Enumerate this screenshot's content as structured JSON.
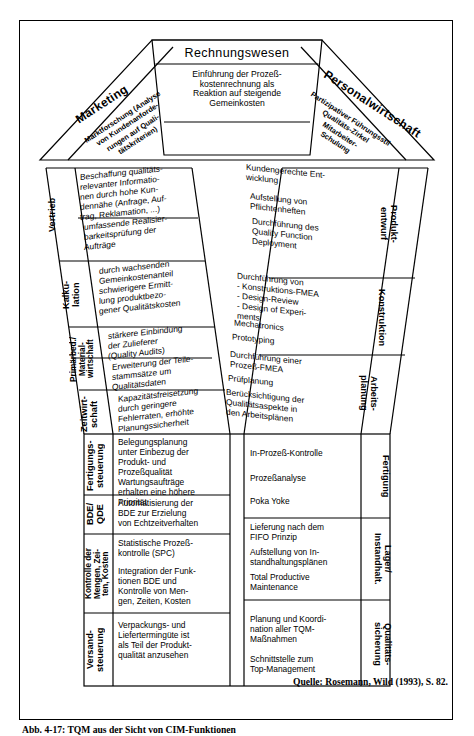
{
  "figure": {
    "source_note": "Quelle: Rosemann, Wild (1993), S. 82.",
    "caption": "Abb. 4-17: TQM aus der Sicht von CIM-Funktionen"
  },
  "roof": {
    "center": {
      "title": "Rechnungswesen",
      "body": "Einführung der Prozeß-\nkostenrechnung als\nReaktion auf steigende\nGemeinkosten"
    },
    "left": {
      "title": "Marketing",
      "body": "Marktforschung (Analyse\nvon Kundenanforde-\nrungen auf Quali-\ntätskriterien)"
    },
    "right": {
      "title": "Personalwirtschaft",
      "body": "Partizipativer Führungsstil\nQualitäts-Zirkel\nMitarbeiter-\nSchulung"
    }
  },
  "left_column": [
    {
      "dept": "Vertrieb",
      "items": [
        "Beschaffung qualitäts-\nrelevanter Informatio-\nnen durch hohe Kun-\ndennähe (Anfrage, Auf-\ntrag, Reklamation, ...)",
        "umfassende Realisier-\nbarkeitsprüfung der\nAufträge"
      ]
    },
    {
      "dept": "Kalku-\nlation",
      "items": [
        "durch wachsenden\nGemeinkostenanteil\nschwierigere Ermitt-\nlung produktbezo-\ngener Qualitätskosten"
      ]
    },
    {
      "dept": "Primärbed./\nMaterial-\nwirtschaft",
      "items": [
        "stärkere Einbindung\nder Zulieferer\n(Quality Audits)",
        "Erweiterung der Teile-\nstammsätze um\nQualitätsdaten"
      ]
    },
    {
      "dept": "Zeitwirt-\nschaft",
      "items": [
        "Kapazitätsfreisetzung\ndurch geringere\nFehlerraten, erhöhte\nPlanungssicherheit"
      ]
    },
    {
      "dept": "Fertigungs-\nsteuerung",
      "items": [
        "Belegungsplanung\nunter Einbezug der\nProdukt- und\nProzeßqualität",
        "Wartungsaufträge\nerhalten eine höhere\nPriorität"
      ]
    },
    {
      "dept": "BDE/\nQDE",
      "items": [
        "Automatisierung der\nBDE zur Erzielung\nvon Echtzeitverhalten"
      ]
    },
    {
      "dept": "Kontrolle der\nMengen, Zei-\nten, Kosten",
      "items": [
        "Statistische Prozeß-\nkontrolle (SPC)",
        "Integration der Funk-\ntionen BDE und\nKontrolle von Men-\ngen, Zeiten, Kosten"
      ]
    },
    {
      "dept": "Versand-\nsteuerung",
      "items": [
        "Verpackungs- und\nLiefertermingüte ist\nals Teil der Produkt-\nqualität anzusehen"
      ]
    }
  ],
  "right_column": [
    {
      "dept": "Produkt-\nentwurf",
      "items": [
        "Kundengerechte Ent-\nwicklung",
        "Aufstellung von\nPflichtenheften",
        "Durchführung des\nQuality Function\nDeployment"
      ]
    },
    {
      "dept": "Konstruktion",
      "items": [
        "Durchführung von\n- Konstruktions-FMEA\n- Design-Review\n- Design of Experi-\n   ments",
        "Mechatronics",
        "Prototyping"
      ]
    },
    {
      "dept": "Arbeits-\nplanung",
      "items": [
        "Durchführung einer\nProzeß-FMEA",
        "Prüfplanung",
        "Berücksichtigung der\nQualitätsaspekte in\nden Arbeitsplänen"
      ]
    },
    {
      "dept": "Fertigung",
      "items": [
        "In-Prozeß-Kontrolle",
        "Prozeßanalyse",
        "Poka Yoke"
      ]
    },
    {
      "dept": "Lager/\nInstandhalt.",
      "items": [
        "Lieferung nach dem\nFIFO Prinzip",
        "Aufstellung von In-\nstandhaltungsplänen",
        "Total Productive\nMaintenance"
      ]
    },
    {
      "dept": "Qualitäts-\nsicherung",
      "items": [
        "Planung und Koordi-\nnation aller TQM-\nMaßnahmen",
        "Schnittstelle zum\nTop-Management"
      ]
    }
  ],
  "colors": {
    "ink": "#000000",
    "paper": "#ffffff"
  }
}
